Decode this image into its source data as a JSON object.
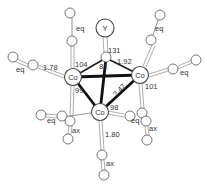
{
  "figure": {
    "atoms": {
      "apex_substituent": "Y",
      "cobalt_left": "Co",
      "cobalt_right": "Co",
      "cobalt_bottom": "Co"
    },
    "ligand_labels": {
      "eq_top_left": "eq",
      "eq_top_right": "eq",
      "eq_left": "eq",
      "eq_right": "eq",
      "eq_lower_left": "eq",
      "eq_lower_right": "eq",
      "ax_lower_left": "ax",
      "ax_lower_right": "ax",
      "ax_bottom": "ax"
    },
    "measurements": {
      "angle_y_c_co": "131",
      "bond_c_co": "1.92",
      "angle_left_top": "104",
      "bond_co_c_eq": "1.78",
      "angle_c_apex": "81",
      "angle_left_bottom": "99",
      "bond_co_co": "2.47",
      "angle_right": "101",
      "angle_bottom": "98",
      "bond_co_c_ax": "1.80"
    }
  }
}
